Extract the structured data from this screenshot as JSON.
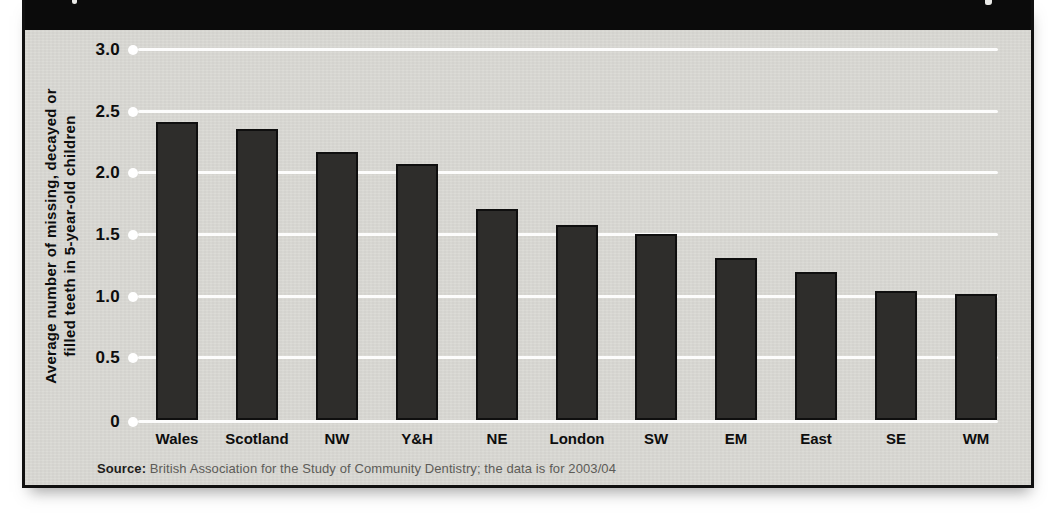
{
  "figure": {
    "header_bg": "#0b0b0b",
    "panel_bg": "#d9d8d3"
  },
  "chart_data": {
    "type": "bar",
    "title": "",
    "categories": [
      "Wales",
      "Scotland",
      "NW",
      "Y&H",
      "NE",
      "London",
      "SW",
      "EM",
      "East",
      "SE",
      "WM"
    ],
    "values": [
      2.42,
      2.36,
      2.17,
      2.08,
      1.71,
      1.58,
      1.51,
      1.31,
      1.2,
      1.05,
      1.02
    ],
    "xlabel": "",
    "ylabel": "Average number of missing, decayed or filled teeth in 5-year-old children",
    "ylabel_lines": [
      "Average number of missing, decayed or",
      "filled teeth in 5-year-old children"
    ],
    "ylim": [
      0,
      3.0
    ],
    "ytick_values": [
      3.0,
      2.5,
      2.0,
      1.5,
      1.0,
      0.5,
      0
    ],
    "ytick_labels": [
      "3.0",
      "2.5",
      "2.0",
      "1.5",
      "1.0",
      "0.5",
      "0"
    ],
    "grid": true,
    "legend": false,
    "gridline_color": "#ffffff",
    "bar_color": "#2e2d2b",
    "bar_border_color": "#0f0f0f",
    "source": {
      "label": "Source:",
      "text": " British Association for the Study of Community Dentistry; the data is for 2003/04"
    }
  }
}
